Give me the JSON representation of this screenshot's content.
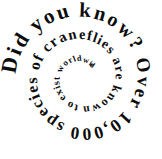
{
  "image": {
    "kind": "spiral-text-graphic",
    "background_color": "#ffffff",
    "text_color": "#0d0d0d",
    "width": 162,
    "height": 159
  },
  "spiral": {
    "full_text": "Did you know? Over 10,000 species of craneflies are known to exist worldwide",
    "direction": "clockwise-inward",
    "center_x": 82,
    "center_y": 78,
    "start_radius": 72,
    "end_radius": 16,
    "start_angle_deg": 182,
    "turns": 2.35,
    "start_font_size": 22,
    "end_font_size": 7.5,
    "segments": [
      {
        "label": "phrase-1",
        "text": "Did you know?"
      },
      {
        "label": "phrase-2",
        "text": "Over 10,000"
      },
      {
        "label": "phrase-3",
        "text": "species of craneflies"
      },
      {
        "label": "phrase-4",
        "text": "are known to"
      },
      {
        "label": "phrase-5",
        "text": "exist worldwide"
      }
    ]
  }
}
